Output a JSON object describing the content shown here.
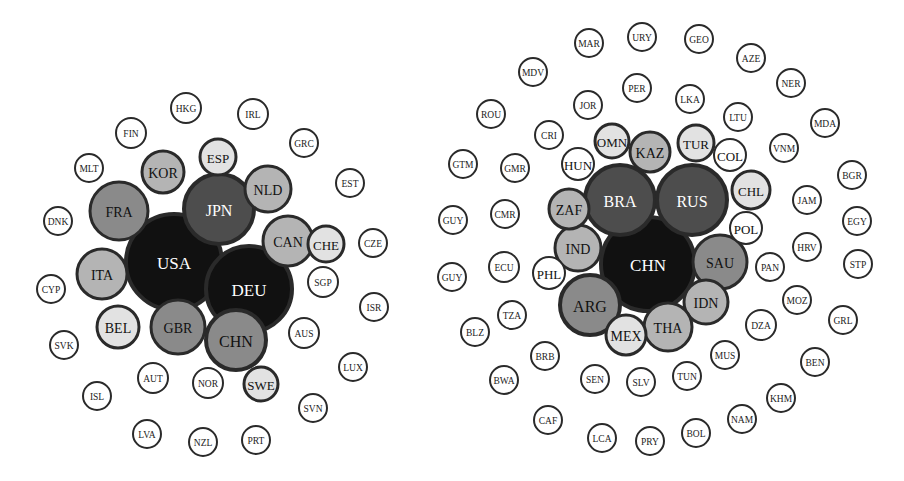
{
  "palette": {
    "black": "#111111",
    "dark": "#4d4d4d",
    "mid": "#8a8a8a",
    "light": "#b4b4b4",
    "pale": "#e2e2e2",
    "white": "#ffffff"
  },
  "diagrams": [
    {
      "id": "left-network",
      "nodes": [
        {
          "label": "USA",
          "x": 174,
          "y": 262,
          "r": 48,
          "fill": "black",
          "text": "#ffffff"
        },
        {
          "label": "DEU",
          "x": 249,
          "y": 289,
          "r": 43,
          "fill": "black",
          "text": "#ffffff"
        },
        {
          "label": "JPN",
          "x": 219,
          "y": 209,
          "r": 35,
          "fill": "dark",
          "text": "#ffffff"
        },
        {
          "label": "CHN",
          "x": 236,
          "y": 340,
          "r": 30,
          "fill": "mid",
          "text": "#111111"
        },
        {
          "label": "GBR",
          "x": 178,
          "y": 327,
          "r": 27,
          "fill": "mid",
          "text": "#111111"
        },
        {
          "label": "FRA",
          "x": 119,
          "y": 211,
          "r": 29,
          "fill": "mid",
          "text": "#111111"
        },
        {
          "label": "ITA",
          "x": 102,
          "y": 274,
          "r": 25,
          "fill": "light",
          "text": "#111111"
        },
        {
          "label": "CAN",
          "x": 288,
          "y": 241,
          "r": 25,
          "fill": "light",
          "text": "#111111"
        },
        {
          "label": "NLD",
          "x": 268,
          "y": 189,
          "r": 23,
          "fill": "light",
          "text": "#111111"
        },
        {
          "label": "KOR",
          "x": 163,
          "y": 172,
          "r": 21,
          "fill": "light",
          "text": "#111111"
        },
        {
          "label": "BEL",
          "x": 118,
          "y": 327,
          "r": 21,
          "fill": "pale",
          "text": "#111111"
        },
        {
          "label": "ESP",
          "x": 218,
          "y": 157,
          "r": 18,
          "fill": "pale",
          "text": "#111111"
        },
        {
          "label": "CHE",
          "x": 326,
          "y": 244,
          "r": 18,
          "fill": "pale",
          "text": "#111111"
        },
        {
          "label": "SWE",
          "x": 261,
          "y": 384,
          "r": 17,
          "fill": "pale",
          "text": "#111111"
        },
        {
          "label": "HKG",
          "x": 186,
          "y": 108,
          "r": 15,
          "fill": "white",
          "text": "#222222"
        },
        {
          "label": "IRL",
          "x": 253,
          "y": 114,
          "r": 15,
          "fill": "white",
          "text": "#222222"
        },
        {
          "label": "FIN",
          "x": 131,
          "y": 133,
          "r": 15,
          "fill": "white",
          "text": "#222222"
        },
        {
          "label": "GRC",
          "x": 304,
          "y": 143,
          "r": 14,
          "fill": "white",
          "text": "#222222"
        },
        {
          "label": "MLT",
          "x": 89,
          "y": 168,
          "r": 14,
          "fill": "white",
          "text": "#222222"
        },
        {
          "label": "EST",
          "x": 350,
          "y": 183,
          "r": 14,
          "fill": "white",
          "text": "#222222"
        },
        {
          "label": "DNK",
          "x": 58,
          "y": 221,
          "r": 14,
          "fill": "white",
          "text": "#222222"
        },
        {
          "label": "CZE",
          "x": 373,
          "y": 243,
          "r": 14,
          "fill": "white",
          "text": "#222222"
        },
        {
          "label": "SGP",
          "x": 323,
          "y": 282,
          "r": 15,
          "fill": "white",
          "text": "#222222"
        },
        {
          "label": "CYP",
          "x": 51,
          "y": 289,
          "r": 14,
          "fill": "white",
          "text": "#222222"
        },
        {
          "label": "ISR",
          "x": 374,
          "y": 307,
          "r": 14,
          "fill": "white",
          "text": "#222222"
        },
        {
          "label": "AUS",
          "x": 304,
          "y": 333,
          "r": 15,
          "fill": "white",
          "text": "#222222"
        },
        {
          "label": "SVK",
          "x": 64,
          "y": 345,
          "r": 14,
          "fill": "white",
          "text": "#222222"
        },
        {
          "label": "AUT",
          "x": 153,
          "y": 378,
          "r": 15,
          "fill": "white",
          "text": "#222222"
        },
        {
          "label": "NOR",
          "x": 208,
          "y": 383,
          "r": 15,
          "fill": "white",
          "text": "#222222"
        },
        {
          "label": "LUX",
          "x": 353,
          "y": 367,
          "r": 14,
          "fill": "white",
          "text": "#222222"
        },
        {
          "label": "ISL",
          "x": 97,
          "y": 396,
          "r": 14,
          "fill": "white",
          "text": "#222222"
        },
        {
          "label": "SVN",
          "x": 313,
          "y": 408,
          "r": 14,
          "fill": "white",
          "text": "#222222"
        },
        {
          "label": "LVA",
          "x": 147,
          "y": 434,
          "r": 14,
          "fill": "white",
          "text": "#222222"
        },
        {
          "label": "NZL",
          "x": 203,
          "y": 442,
          "r": 14,
          "fill": "white",
          "text": "#222222"
        },
        {
          "label": "PRT",
          "x": 256,
          "y": 440,
          "r": 14,
          "fill": "white",
          "text": "#222222"
        }
      ]
    },
    {
      "id": "right-network",
      "nodes": [
        {
          "label": "CHN",
          "x": 648,
          "y": 264,
          "r": 47,
          "fill": "black",
          "text": "#ffffff"
        },
        {
          "label": "BRA",
          "x": 620,
          "y": 200,
          "r": 35,
          "fill": "dark",
          "text": "#ffffff"
        },
        {
          "label": "RUS",
          "x": 692,
          "y": 200,
          "r": 35,
          "fill": "dark",
          "text": "#ffffff"
        },
        {
          "label": "SAU",
          "x": 720,
          "y": 262,
          "r": 27,
          "fill": "mid",
          "text": "#111111"
        },
        {
          "label": "ARG",
          "x": 590,
          "y": 305,
          "r": 30,
          "fill": "mid",
          "text": "#111111"
        },
        {
          "label": "IDN",
          "x": 706,
          "y": 302,
          "r": 22,
          "fill": "light",
          "text": "#111111"
        },
        {
          "label": "THA",
          "x": 668,
          "y": 327,
          "r": 24,
          "fill": "light",
          "text": "#111111"
        },
        {
          "label": "MEX",
          "x": 626,
          "y": 335,
          "r": 20,
          "fill": "pale",
          "text": "#111111"
        },
        {
          "label": "IND",
          "x": 578,
          "y": 248,
          "r": 23,
          "fill": "light",
          "text": "#111111"
        },
        {
          "label": "ZAF",
          "x": 569,
          "y": 209,
          "r": 20,
          "fill": "light",
          "text": "#111111"
        },
        {
          "label": "KAZ",
          "x": 650,
          "y": 152,
          "r": 20,
          "fill": "light",
          "text": "#111111"
        },
        {
          "label": "TUR",
          "x": 696,
          "y": 143,
          "r": 18,
          "fill": "pale",
          "text": "#111111"
        },
        {
          "label": "CHL",
          "x": 751,
          "y": 190,
          "r": 19,
          "fill": "pale",
          "text": "#111111"
        },
        {
          "label": "OMN",
          "x": 612,
          "y": 141,
          "r": 17,
          "fill": "pale",
          "text": "#111111"
        },
        {
          "label": "COL",
          "x": 730,
          "y": 155,
          "r": 16,
          "fill": "white",
          "text": "#111111"
        },
        {
          "label": "POL",
          "x": 746,
          "y": 228,
          "r": 16,
          "fill": "white",
          "text": "#111111"
        },
        {
          "label": "HUN",
          "x": 578,
          "y": 164,
          "r": 16,
          "fill": "white",
          "text": "#111111"
        },
        {
          "label": "PHL",
          "x": 549,
          "y": 273,
          "r": 16,
          "fill": "white",
          "text": "#111111"
        },
        {
          "label": "MAR",
          "x": 589,
          "y": 43,
          "r": 14,
          "fill": "white",
          "text": "#222222"
        },
        {
          "label": "URY",
          "x": 642,
          "y": 37,
          "r": 14,
          "fill": "white",
          "text": "#222222"
        },
        {
          "label": "GEO",
          "x": 699,
          "y": 39,
          "r": 14,
          "fill": "white",
          "text": "#222222"
        },
        {
          "label": "AZE",
          "x": 751,
          "y": 58,
          "r": 14,
          "fill": "white",
          "text": "#222222"
        },
        {
          "label": "MDV",
          "x": 533,
          "y": 72,
          "r": 14,
          "fill": "white",
          "text": "#222222"
        },
        {
          "label": "NER",
          "x": 791,
          "y": 83,
          "r": 14,
          "fill": "white",
          "text": "#222222"
        },
        {
          "label": "PER",
          "x": 637,
          "y": 88,
          "r": 14,
          "fill": "white",
          "text": "#222222"
        },
        {
          "label": "ROU",
          "x": 491,
          "y": 114,
          "r": 14,
          "fill": "white",
          "text": "#222222"
        },
        {
          "label": "JOR",
          "x": 588,
          "y": 105,
          "r": 14,
          "fill": "white",
          "text": "#222222"
        },
        {
          "label": "LKA",
          "x": 690,
          "y": 99,
          "r": 14,
          "fill": "white",
          "text": "#222222"
        },
        {
          "label": "LTU",
          "x": 738,
          "y": 117,
          "r": 14,
          "fill": "white",
          "text": "#222222"
        },
        {
          "label": "MDA",
          "x": 825,
          "y": 123,
          "r": 14,
          "fill": "white",
          "text": "#222222"
        },
        {
          "label": "CRI",
          "x": 549,
          "y": 135,
          "r": 14,
          "fill": "white",
          "text": "#222222"
        },
        {
          "label": "VNM",
          "x": 784,
          "y": 148,
          "r": 14,
          "fill": "white",
          "text": "#222222"
        },
        {
          "label": "GTM",
          "x": 463,
          "y": 164,
          "r": 14,
          "fill": "white",
          "text": "#222222"
        },
        {
          "label": "GMR",
          "x": 515,
          "y": 168,
          "r": 14,
          "fill": "white",
          "text": "#222222"
        },
        {
          "label": "BGR",
          "x": 852,
          "y": 175,
          "r": 14,
          "fill": "white",
          "text": "#222222"
        },
        {
          "label": "JAM",
          "x": 807,
          "y": 200,
          "r": 14,
          "fill": "white",
          "text": "#222222"
        },
        {
          "label": "GUY",
          "x": 453,
          "y": 220,
          "r": 14,
          "fill": "white",
          "text": "#222222"
        },
        {
          "label": "CMR",
          "x": 505,
          "y": 214,
          "r": 14,
          "fill": "white",
          "text": "#222222"
        },
        {
          "label": "EGY",
          "x": 857,
          "y": 221,
          "r": 14,
          "fill": "white",
          "text": "#222222"
        },
        {
          "label": "HRV",
          "x": 807,
          "y": 247,
          "r": 14,
          "fill": "white",
          "text": "#222222"
        },
        {
          "label": "STP",
          "x": 858,
          "y": 264,
          "r": 14,
          "fill": "white",
          "text": "#222222"
        },
        {
          "label": "ECU",
          "x": 504,
          "y": 267,
          "r": 15,
          "fill": "white",
          "text": "#222222"
        },
        {
          "label": "PAN",
          "x": 770,
          "y": 267,
          "r": 14,
          "fill": "white",
          "text": "#222222"
        },
        {
          "label": "GUY",
          "x": 452,
          "y": 277,
          "r": 14,
          "fill": "white",
          "text": "#222222"
        },
        {
          "label": "MOZ",
          "x": 797,
          "y": 300,
          "r": 14,
          "fill": "white",
          "text": "#222222"
        },
        {
          "label": "TZA",
          "x": 512,
          "y": 315,
          "r": 14,
          "fill": "white",
          "text": "#222222"
        },
        {
          "label": "DZA",
          "x": 761,
          "y": 325,
          "r": 15,
          "fill": "white",
          "text": "#222222"
        },
        {
          "label": "GRL",
          "x": 843,
          "y": 320,
          "r": 14,
          "fill": "white",
          "text": "#222222"
        },
        {
          "label": "BLZ",
          "x": 475,
          "y": 332,
          "r": 14,
          "fill": "white",
          "text": "#222222"
        },
        {
          "label": "MUS",
          "x": 725,
          "y": 355,
          "r": 14,
          "fill": "white",
          "text": "#222222"
        },
        {
          "label": "BEN",
          "x": 815,
          "y": 362,
          "r": 14,
          "fill": "white",
          "text": "#222222"
        },
        {
          "label": "BRB",
          "x": 545,
          "y": 356,
          "r": 14,
          "fill": "white",
          "text": "#222222"
        },
        {
          "label": "BWA",
          "x": 504,
          "y": 380,
          "r": 14,
          "fill": "white",
          "text": "#222222"
        },
        {
          "label": "SEN",
          "x": 595,
          "y": 379,
          "r": 14,
          "fill": "white",
          "text": "#222222"
        },
        {
          "label": "SLV",
          "x": 641,
          "y": 382,
          "r": 14,
          "fill": "white",
          "text": "#222222"
        },
        {
          "label": "TUN",
          "x": 687,
          "y": 376,
          "r": 14,
          "fill": "white",
          "text": "#222222"
        },
        {
          "label": "KHM",
          "x": 781,
          "y": 398,
          "r": 14,
          "fill": "white",
          "text": "#222222"
        },
        {
          "label": "NAM",
          "x": 742,
          "y": 419,
          "r": 14,
          "fill": "white",
          "text": "#222222"
        },
        {
          "label": "CAF",
          "x": 548,
          "y": 420,
          "r": 14,
          "fill": "white",
          "text": "#222222"
        },
        {
          "label": "LCA",
          "x": 602,
          "y": 438,
          "r": 14,
          "fill": "white",
          "text": "#222222"
        },
        {
          "label": "PRY",
          "x": 650,
          "y": 441,
          "r": 14,
          "fill": "white",
          "text": "#222222"
        },
        {
          "label": "BOL",
          "x": 696,
          "y": 433,
          "r": 14,
          "fill": "white",
          "text": "#222222"
        }
      ]
    }
  ]
}
